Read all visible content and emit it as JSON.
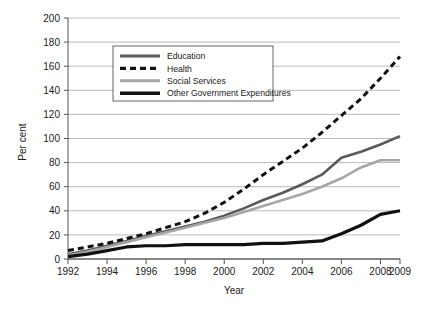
{
  "chart_data": {
    "type": "line",
    "title": "",
    "xlabel": "Year",
    "ylabel": "Per cent",
    "xlim": [
      1992,
      2009
    ],
    "ylim": [
      0,
      200
    ],
    "grid": "horizontal",
    "legend_position": "top-center-inside",
    "x": [
      1992,
      1993,
      1994,
      1995,
      1996,
      1997,
      1998,
      1999,
      2000,
      2001,
      2002,
      2003,
      2004,
      2005,
      2006,
      2007,
      2008,
      2009
    ],
    "xticks": [
      "1992",
      "1994",
      "1996",
      "1998",
      "2000",
      "2002",
      "2004",
      "2006",
      "2008",
      "2009"
    ],
    "xtick_values": [
      1992,
      1994,
      1996,
      1998,
      2000,
      2002,
      2004,
      2006,
      2008,
      2009
    ],
    "yticks": [
      "0",
      "20",
      "40",
      "60",
      "80",
      "100",
      "120",
      "140",
      "160",
      "180",
      "200"
    ],
    "ytick_values": [
      0,
      20,
      40,
      60,
      80,
      100,
      120,
      140,
      160,
      180,
      200
    ],
    "series": [
      {
        "name": "Education",
        "color": "#595959",
        "style": "solid",
        "width": 2.6,
        "values": [
          4,
          7,
          11,
          15,
          19,
          23,
          27,
          31,
          36,
          42,
          49,
          55,
          62,
          70,
          84,
          89,
          95,
          102
        ]
      },
      {
        "name": "Health",
        "color": "#111111",
        "style": "dashed",
        "width": 3.0,
        "values": [
          7,
          10,
          13,
          17,
          21,
          26,
          31,
          38,
          47,
          58,
          70,
          81,
          92,
          105,
          119,
          133,
          150,
          168
        ]
      },
      {
        "name": "Social Services",
        "color": "#a6a6a6",
        "style": "solid",
        "width": 2.6,
        "values": [
          3,
          6,
          10,
          14,
          18,
          22,
          26,
          30,
          34,
          39,
          44,
          49,
          54,
          60,
          67,
          76,
          82,
          82
        ]
      },
      {
        "name": "Other Government Expenditures",
        "color": "#111111",
        "style": "solid",
        "width": 3.2,
        "values": [
          2,
          4,
          7,
          10,
          11,
          11,
          12,
          12,
          12,
          12,
          13,
          13,
          14,
          15,
          21,
          28,
          37,
          40
        ]
      }
    ]
  },
  "legend": {
    "items": [
      {
        "label": "Education"
      },
      {
        "label": "Health"
      },
      {
        "label": "Social Services"
      },
      {
        "label": "Other Government Expenditures"
      }
    ]
  },
  "axes": {
    "y_label": "Per cent",
    "x_label": "Year"
  }
}
